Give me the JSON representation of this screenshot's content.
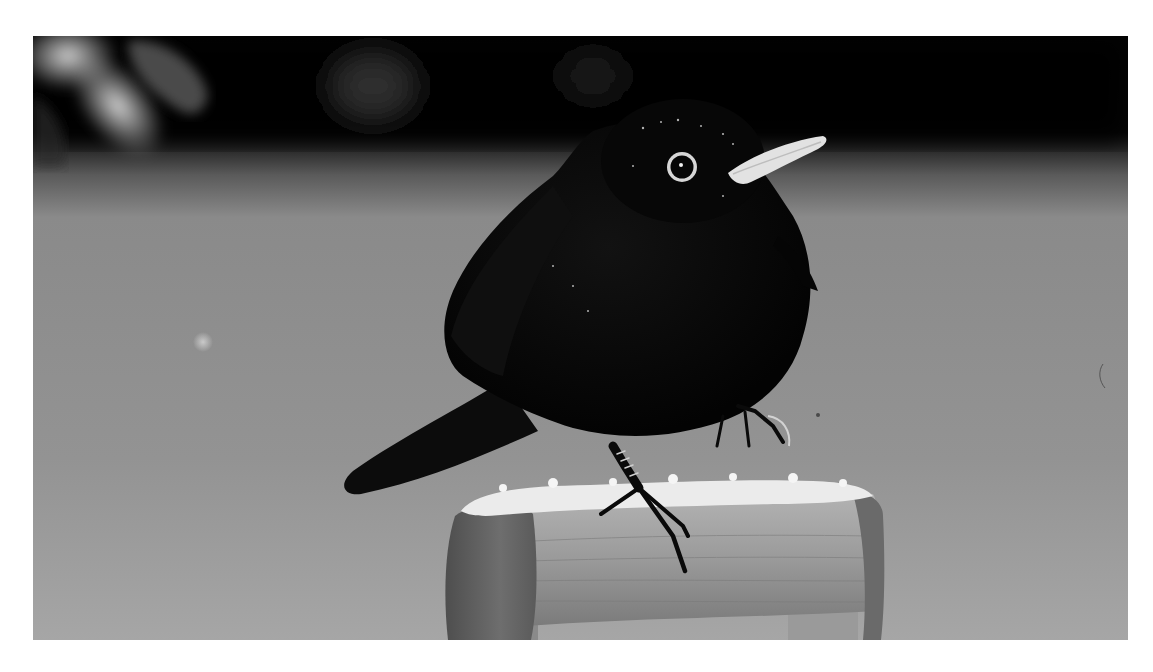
{
  "page": {
    "background": "#ffffff",
    "top_text_fragment": "",
    "top_text_note": "cropped line of text above photo, only descenders visible"
  },
  "photo": {
    "subject": "Eurasian blackbird perched on snow-covered wooden handle",
    "style": "black-and-white photograph",
    "bounds": {
      "x": 33,
      "y": 36,
      "width": 1095,
      "height": 604
    },
    "colors": {
      "background_dark": "#050505",
      "background_mid": "#8a8a8a",
      "background_light": "#a4a4a4",
      "bird_body": "#070707",
      "beak": "#e4e4e4",
      "eye_ring": "#d8d8d8",
      "snow": "#e9e9e9",
      "wood": "#9a9a9a",
      "wood_dark": "#5e5e5e"
    },
    "elements": [
      {
        "name": "dark-foliage-band",
        "position": "top"
      },
      {
        "name": "snowy-branch-highlight",
        "position": "top-left"
      },
      {
        "name": "blackbird",
        "position": "center"
      },
      {
        "name": "eye",
        "position": "head"
      },
      {
        "name": "beak",
        "position": "head-right"
      },
      {
        "name": "tail",
        "position": "lower-left of body"
      },
      {
        "name": "legs-and-claws",
        "position": "below body"
      },
      {
        "name": "wooden-handle",
        "position": "bottom-center"
      },
      {
        "name": "snow-cap",
        "position": "top of handle"
      }
    ]
  }
}
